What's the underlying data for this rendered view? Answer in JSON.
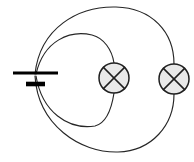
{
  "figure": {
    "width": 194,
    "height": 162,
    "background_color": "#ffffff"
  },
  "colors": {
    "wire_stroke": "#262626",
    "lamp_stroke": "#1f1f1f",
    "lamp_fill": "#e9e9e9",
    "battery_stroke": "#000000"
  },
  "components": {
    "battery": {
      "name": "battery",
      "symbol": "battery-cell",
      "terminal_long_plate": {
        "x1": 13,
        "y1": 73,
        "x2": 58,
        "y2": 73
      },
      "terminal_short_plate": {
        "x1": 26,
        "y1": 84,
        "x2": 45,
        "y2": 84
      }
    },
    "lamps": [
      {
        "name": "lamp-1",
        "symbol": "lamp-cross-circle",
        "center_x": 114,
        "center_y": 78,
        "radius": 15,
        "loop": "inner"
      },
      {
        "name": "lamp-2",
        "symbol": "lamp-cross-circle",
        "center_x": 174,
        "center_y": 79,
        "radius": 15,
        "loop": "outer"
      }
    ],
    "loops": [
      {
        "name": "inner-loop",
        "description": "Smaller wire loop from battery through lamp 1",
        "path_upper": "M 36 74 C 44 40 70 30 92 35 C 104 38 112 50 114 63",
        "path_lower": "M 36 76 C 42 112 68 130 95 126 C 107 123 112 106 114 93"
      },
      {
        "name": "outer-loop",
        "description": "Larger wire loop from battery through lamp 2",
        "path_upper": "M 35 74 C 40 28 78 6 116 7 C 152 8 174 32 174 64",
        "path_lower": "M 35 76 C 38 125 80 153 118 152 C 152 151 174 125 174 94"
      }
    ]
  }
}
